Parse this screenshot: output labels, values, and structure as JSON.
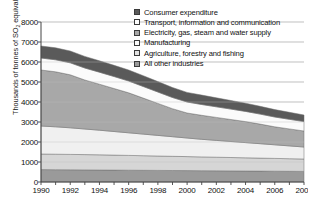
{
  "chart_data": {
    "type": "area",
    "stacked": true,
    "title": "",
    "xlabel": "",
    "ylabel": "Thousands of tonnes of SO2 equivalent",
    "ylabel_parts": {
      "before": "Thousands of tonnes of SO",
      "sub": "2",
      "after": " equivalent"
    },
    "x": [
      1990,
      1991,
      1992,
      1993,
      1994,
      1995,
      1996,
      1997,
      1998,
      1999,
      2000,
      2001,
      2002,
      2003,
      2004,
      2005,
      2006,
      2007,
      2008
    ],
    "xlim": [
      1990,
      2008
    ],
    "ylim": [
      0,
      8000
    ],
    "yticks": [
      0,
      1000,
      2000,
      3000,
      4000,
      5000,
      6000,
      7000,
      8000
    ],
    "xticks": [
      1990,
      1992,
      1994,
      1996,
      1998,
      2000,
      2002,
      2004,
      2006,
      2008
    ],
    "xtick_labels": [
      "1990",
      "1992",
      "1994",
      "1996",
      "1998",
      "2000",
      "2002",
      "2004",
      "2006",
      "2008"
    ],
    "ytick_labels": [
      "0",
      "1000",
      "2000",
      "3000",
      "4000",
      "5000",
      "6000",
      "7000",
      "8000"
    ],
    "grid": true,
    "grid_axis": "y",
    "legend_position": "top-right",
    "series": [
      {
        "name": "Consumer expenditure",
        "color": "#5a5a5a",
        "order": 6,
        "values": [
          600,
          600,
          590,
          580,
          570,
          560,
          550,
          540,
          520,
          500,
          480,
          470,
          450,
          430,
          410,
          390,
          370,
          350,
          330
        ]
      },
      {
        "name": "Transport, information and communication",
        "color": "#fbfbfb",
        "order": 5,
        "values": [
          600,
          600,
          600,
          600,
          600,
          600,
          590,
          580,
          570,
          560,
          550,
          540,
          530,
          520,
          510,
          500,
          490,
          480,
          470
        ]
      },
      {
        "name": "Electricity, gas, steam and water supply",
        "color": "#a8a8a8",
        "order": 4,
        "values": [
          2800,
          2750,
          2650,
          2450,
          2300,
          2150,
          2000,
          1800,
          1600,
          1400,
          1250,
          1200,
          1150,
          1100,
          1050,
          980,
          900,
          850,
          800
        ]
      },
      {
        "name": "Manufacturing",
        "color": "#f0f0f0",
        "order": 3,
        "values": [
          1400,
          1370,
          1330,
          1280,
          1230,
          1180,
          1130,
          1080,
          1030,
          980,
          930,
          880,
          840,
          800,
          760,
          720,
          680,
          640,
          600
        ]
      },
      {
        "name": "Agriculture, forestry and fishing",
        "color": "#d6d6d6",
        "order": 2,
        "values": [
          780,
          775,
          770,
          765,
          760,
          750,
          740,
          730,
          720,
          710,
          700,
          690,
          680,
          670,
          660,
          650,
          640,
          630,
          620
        ],
        "note": "light band just above the bottom dark band"
      },
      {
        "name": "All other industries",
        "color": "#9a9a9a",
        "order": 1,
        "values": [
          620,
          615,
          610,
          605,
          600,
          595,
          590,
          585,
          580,
          575,
          570,
          565,
          560,
          555,
          550,
          545,
          540,
          535,
          530
        ]
      }
    ],
    "totals": [
      6800,
      6710,
      6550,
      6280,
      6060,
      5835,
      5600,
      5315,
      5020,
      4725,
      4480,
      4345,
      4210,
      4075,
      3940,
      3785,
      3620,
      3485,
      3350
    ]
  },
  "legend": {
    "items": [
      {
        "label": "Consumer expenditure",
        "swatch": "#5a5a5a"
      },
      {
        "label": "Transport, information and communication",
        "swatch": "#fdfdfd"
      },
      {
        "label": "Electricity, gas, steam and water supply",
        "swatch": "#a8a8a8"
      },
      {
        "label": "Manufacturing",
        "swatch": "#fbfbfb"
      },
      {
        "label": "Agriculture, forestry and fishing",
        "swatch": "#e2e2e2"
      },
      {
        "label": "All other industries",
        "swatch": "#9a9a9a"
      }
    ]
  },
  "colors": {
    "axis": "#444444",
    "grid": "#bfbfbf",
    "text": "#111111",
    "background": "#ffffff"
  }
}
